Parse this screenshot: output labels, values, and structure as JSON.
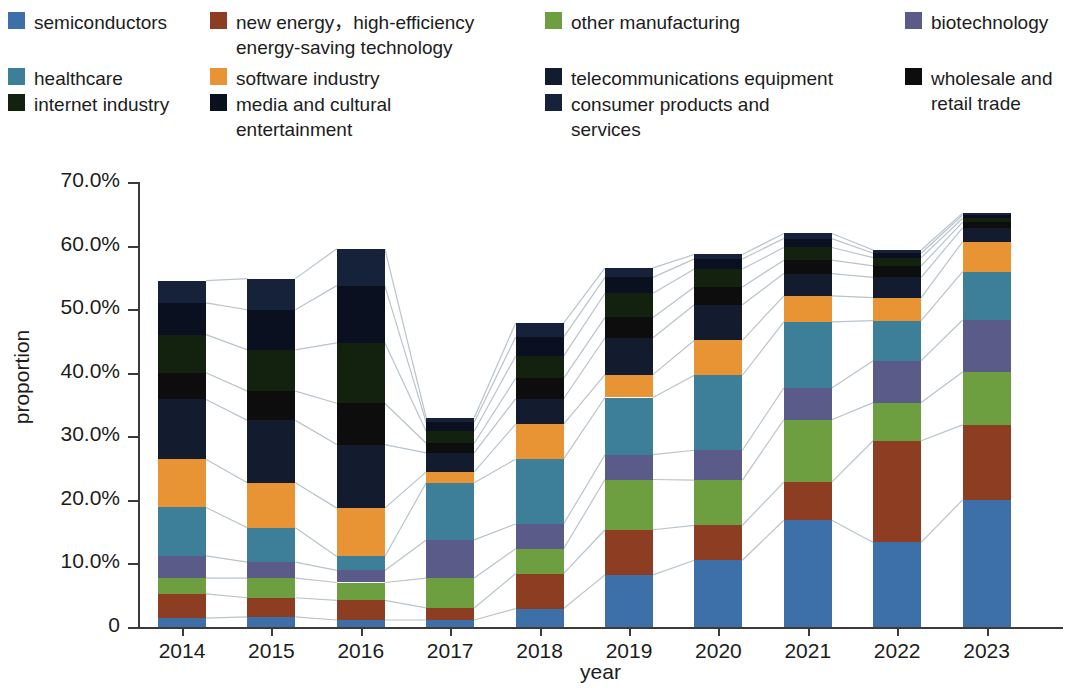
{
  "legend": {
    "items": [
      {
        "label": "semiconductors",
        "color": "#3d6fa8",
        "key": "semiconductors"
      },
      {
        "label": "new energy，high-efficiency\nenergy-saving technology",
        "color": "#8c3d22",
        "key": "new_energy"
      },
      {
        "label": "other manufacturing",
        "color": "#6d9e3f",
        "key": "other_manufacturing"
      },
      {
        "label": "biotechnology",
        "color": "#5b5b8a",
        "key": "biotechnology"
      },
      {
        "label": "healthcare",
        "color": "#3d7f99",
        "key": "healthcare"
      },
      {
        "label": "software industry",
        "color": "#e89435",
        "key": "software_industry"
      },
      {
        "label": "telecommunications equipment",
        "color": "#121c2e",
        "key": "telecommunications_equipment"
      },
      {
        "label": "wholesale and\nretail trade",
        "color": "#0d0d0d",
        "key": "wholesale_retail"
      },
      {
        "label": "internet industry",
        "color": "#13210f",
        "key": "internet_industry"
      },
      {
        "label": "media and cultural\nentertainment",
        "color": "#0b1020",
        "key": "media_cultural"
      },
      {
        "label": "consumer products and\nservices",
        "color": "#16223a",
        "key": "consumer_products"
      }
    ]
  },
  "chart_data": {
    "type": "bar",
    "stacked": true,
    "title": "",
    "xlabel": "year",
    "ylabel": "proportion",
    "ylim": [
      0,
      70
    ],
    "ytick_labels": [
      "0",
      "10.0%",
      "20.0%",
      "30.0%",
      "40.0%",
      "50.0%",
      "60.0%",
      "70.0%"
    ],
    "ytick_values": [
      0,
      10,
      20,
      30,
      40,
      50,
      60,
      70
    ],
    "grid": false,
    "legend_position": "top",
    "categories": [
      "2014",
      "2015",
      "2016",
      "2017",
      "2018",
      "2019",
      "2020",
      "2021",
      "2022",
      "2023"
    ],
    "series": [
      {
        "name": "semiconductors",
        "color": "#3d6fa8",
        "values": [
          1.4,
          1.6,
          1.1,
          1.1,
          2.9,
          8.2,
          10.5,
          16.8,
          13.3,
          20.0
        ]
      },
      {
        "name": "new energy，high-efficiency energy-saving technology",
        "color": "#8c3d22",
        "values": [
          3.8,
          3.0,
          3.1,
          1.9,
          5.5,
          7.1,
          5.5,
          6.0,
          16.0,
          11.8
        ]
      },
      {
        "name": "other manufacturing",
        "color": "#6d9e3f",
        "values": [
          2.5,
          3.1,
          2.8,
          4.7,
          3.9,
          7.9,
          7.1,
          9.8,
          6.0,
          8.3
        ]
      },
      {
        "name": "biotechnology",
        "color": "#5b5b8a",
        "values": [
          3.5,
          2.5,
          1.9,
          6.0,
          3.9,
          3.9,
          4.7,
          5.0,
          6.6,
          8.2
        ]
      },
      {
        "name": "healthcare",
        "color": "#3d7f99",
        "values": [
          7.6,
          5.4,
          2.2,
          9.0,
          10.2,
          9.0,
          11.8,
          10.4,
          6.3,
          7.6
        ]
      },
      {
        "name": "software industry",
        "color": "#e89435",
        "values": [
          7.6,
          7.1,
          7.6,
          1.7,
          5.5,
          3.6,
          5.5,
          4.1,
          3.6,
          4.7
        ]
      },
      {
        "name": "telecommunications equipment",
        "color": "#121c2e",
        "values": [
          9.4,
          9.8,
          10.0,
          3.0,
          4.0,
          5.8,
          5.6,
          3.5,
          3.2,
          2.2
        ]
      },
      {
        "name": "wholesale and retail trade",
        "color": "#0d0d0d",
        "values": [
          4.2,
          4.6,
          6.5,
          1.5,
          3.2,
          3.2,
          2.8,
          2.1,
          1.8,
          0.9
        ]
      },
      {
        "name": "internet industry",
        "color": "#13210f",
        "values": [
          6.0,
          6.5,
          9.5,
          1.9,
          3.5,
          3.8,
          2.8,
          2.0,
          1.3,
          0.6
        ]
      },
      {
        "name": "media and cultural entertainment",
        "color": "#0b1020",
        "values": [
          5.0,
          6.3,
          9.0,
          1.4,
          3.0,
          2.5,
          1.6,
          1.4,
          0.7,
          0.5
        ]
      },
      {
        "name": "consumer products and services",
        "color": "#16223a",
        "values": [
          3.5,
          4.9,
          5.8,
          0.7,
          2.2,
          1.5,
          0.7,
          0.8,
          0.5,
          0.3
        ]
      }
    ],
    "totals": [
      54.5,
      54.8,
      59.5,
      32.9,
      47.8,
      56.5,
      58.6,
      61.9,
      59.3,
      64.9
    ]
  }
}
